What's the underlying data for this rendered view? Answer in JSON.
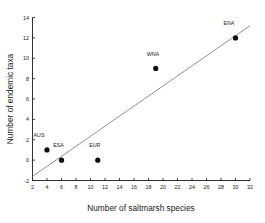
{
  "chart_data": {
    "type": "scatter",
    "title": "",
    "xlabel": "Number of saltmarsh species",
    "ylabel": "Number of endemic taxa",
    "xlim": [
      2,
      32
    ],
    "ylim": [
      -2,
      14
    ],
    "xticks": [
      2,
      4,
      6,
      8,
      10,
      12,
      14,
      16,
      18,
      20,
      22,
      24,
      26,
      28,
      30,
      32
    ],
    "yticks": [
      -2,
      0,
      2,
      4,
      6,
      8,
      10,
      12,
      14
    ],
    "grid": false,
    "legend": null,
    "points": [
      {
        "label": "AUS",
        "x": 4,
        "y": 1,
        "label_dx": -1.1,
        "label_dy": 1.25
      },
      {
        "label": "ESA",
        "x": 6,
        "y": 0,
        "label_dx": -0.4,
        "label_dy": 1.25
      },
      {
        "label": "EUR",
        "x": 11,
        "y": 0,
        "label_dx": -0.4,
        "label_dy": 1.25
      },
      {
        "label": "WNA",
        "x": 19,
        "y": 9,
        "label_dx": -0.4,
        "label_dy": 1.25
      },
      {
        "label": "ENA",
        "x": 30,
        "y": 12,
        "label_dx": -0.9,
        "label_dy": 1.25
      }
    ],
    "trend_line": {
      "x0": 2,
      "y0": -1.6,
      "x1": 32,
      "y1": 13.2,
      "color": "#7d7d7d"
    },
    "marker": {
      "shape": "circle",
      "color": "#0d0d0d",
      "radius_px": 2.6
    }
  },
  "axes": {
    "x_tick_labels": [
      "2",
      "4",
      "6",
      "8",
      "10",
      "12",
      "14",
      "16",
      "18",
      "20",
      "22",
      "24",
      "26",
      "28",
      "30",
      "32"
    ],
    "y_tick_labels": [
      "-2",
      "0",
      "2",
      "4",
      "6",
      "8",
      "10",
      "12",
      "14"
    ]
  }
}
